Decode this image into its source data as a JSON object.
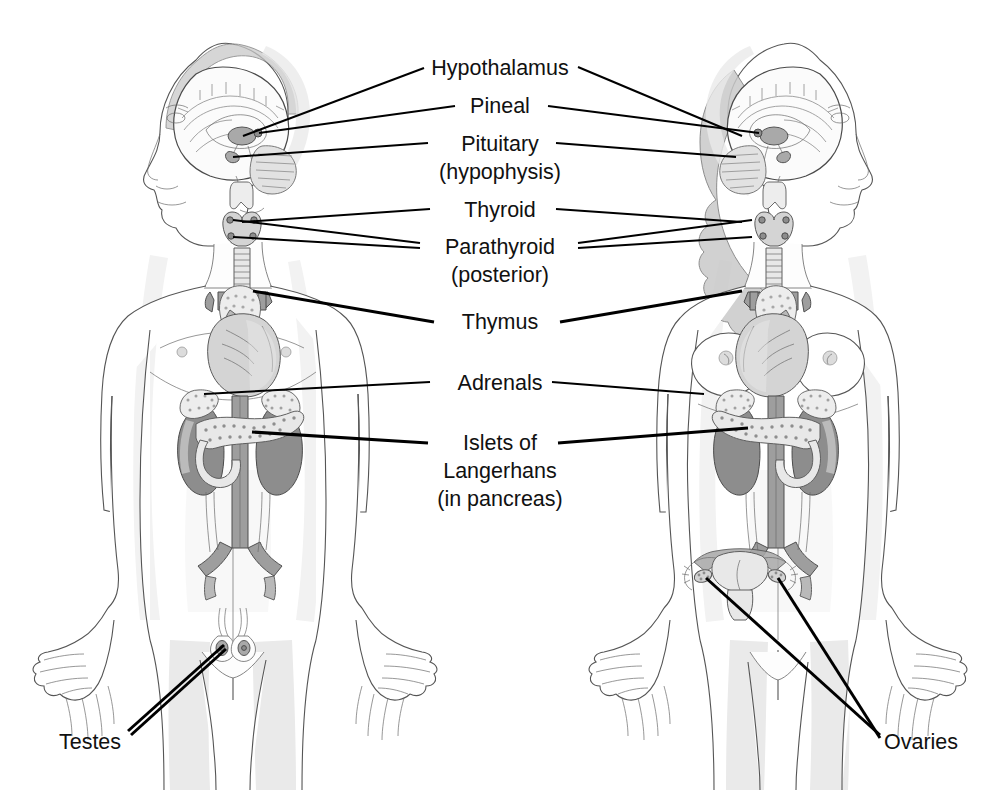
{
  "figure": {
    "type": "anatomical-diagram",
    "background_color": "#ffffff",
    "label_color": "#111111",
    "leader_line_color": "#000000"
  },
  "panels": [
    {
      "id": "male",
      "name": "male-figure",
      "side": "left",
      "facing": "left"
    },
    {
      "id": "female",
      "name": "female-figure",
      "side": "right",
      "facing": "right"
    }
  ],
  "labels": [
    {
      "id": "hypothalamus",
      "text": "Hypothalamus",
      "sub": "",
      "x": 500,
      "y": 67
    },
    {
      "id": "pineal",
      "text": "Pineal",
      "sub": "",
      "x": 500,
      "y": 105
    },
    {
      "id": "pituitary",
      "text": "Pituitary",
      "sub": "(hypophysis)",
      "x": 500,
      "y": 143
    },
    {
      "id": "thyroid",
      "text": "Thyroid",
      "sub": "",
      "x": 500,
      "y": 209
    },
    {
      "id": "parathyroid",
      "text": "Parathyroid",
      "sub": "(posterior)",
      "x": 500,
      "y": 246
    },
    {
      "id": "thymus",
      "text": "Thymus",
      "sub": "",
      "x": 500,
      "y": 321
    },
    {
      "id": "adrenals",
      "text": "Adrenals",
      "sub": "",
      "x": 500,
      "y": 382
    },
    {
      "id": "islets",
      "text": "Islets of",
      "sub": "Langerhans",
      "sub2": "(in pancreas)",
      "x": 500,
      "y": 442
    },
    {
      "id": "testes",
      "text": "Testes",
      "sub": "",
      "x": 90,
      "y": 741
    },
    {
      "id": "ovaries",
      "text": "Ovaries",
      "sub": "",
      "x": 921,
      "y": 741
    }
  ],
  "label_sublines": {
    "pituitary_sub": "(hypophysis)",
    "parathyroid_sub": "(posterior)",
    "islets_sub": "Langerhans",
    "islets_sub2": "(in pancreas)"
  },
  "organs": [
    {
      "name": "hypothalamus",
      "present_in": [
        "male",
        "female"
      ]
    },
    {
      "name": "pineal-gland",
      "present_in": [
        "male",
        "female"
      ]
    },
    {
      "name": "pituitary-gland",
      "present_in": [
        "male",
        "female"
      ]
    },
    {
      "name": "thyroid-gland",
      "present_in": [
        "male",
        "female"
      ]
    },
    {
      "name": "parathyroid-glands",
      "present_in": [
        "male",
        "female"
      ]
    },
    {
      "name": "thymus",
      "present_in": [
        "male",
        "female"
      ]
    },
    {
      "name": "adrenal-glands",
      "present_in": [
        "male",
        "female"
      ]
    },
    {
      "name": "pancreas-islets",
      "present_in": [
        "male",
        "female"
      ]
    },
    {
      "name": "testes",
      "present_in": [
        "male"
      ]
    },
    {
      "name": "ovaries",
      "present_in": [
        "female"
      ]
    },
    {
      "name": "heart",
      "present_in": [
        "male",
        "female"
      ]
    },
    {
      "name": "kidneys",
      "present_in": [
        "male",
        "female"
      ]
    },
    {
      "name": "aorta",
      "present_in": [
        "male",
        "female"
      ]
    },
    {
      "name": "trachea",
      "present_in": [
        "male",
        "female"
      ]
    },
    {
      "name": "brain",
      "present_in": [
        "male",
        "female"
      ]
    },
    {
      "name": "uterus",
      "present_in": [
        "female"
      ]
    }
  ]
}
